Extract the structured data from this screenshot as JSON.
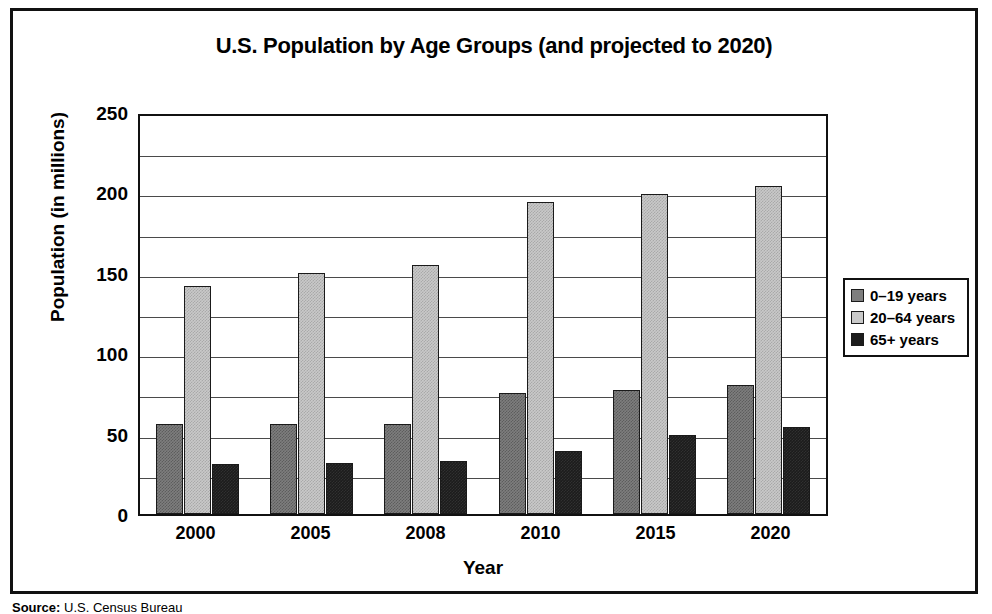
{
  "chart_data": {
    "type": "bar",
    "title": "U.S. Population by Age Groups (and projected to 2020)",
    "xlabel": "Year",
    "ylabel": "Population (in millions)",
    "categories": [
      "2000",
      "2005",
      "2008",
      "2010",
      "2015",
      "2020"
    ],
    "series": [
      {
        "name": "0–19 years",
        "color": "#7e7e7e",
        "values": [
          56,
          56,
          56,
          75,
          77,
          80
        ]
      },
      {
        "name": "20–64 years",
        "color": "#c9c9c9",
        "values": [
          142,
          150,
          155,
          194,
          199,
          204
        ]
      },
      {
        "name": "65+ years",
        "color": "#1c1c1c",
        "values": [
          31,
          32,
          33,
          39,
          49,
          54
        ]
      }
    ],
    "ylim": [
      0,
      250
    ],
    "ytick_labels": [
      "250",
      "200",
      "150",
      "100",
      "50",
      "0"
    ],
    "ytick_values": [
      250,
      200,
      150,
      100,
      50,
      0
    ],
    "gridline_values": [
      225,
      200,
      175,
      150,
      125,
      100,
      75,
      50,
      25
    ],
    "grid": true,
    "legend_position": "right"
  },
  "legend": {
    "items": [
      {
        "label": "0–19 years"
      },
      {
        "label": "20–64 years"
      },
      {
        "label": "65+ years"
      }
    ]
  },
  "source": {
    "prefix": "Source:",
    "text": " U.S. Census Bureau"
  }
}
